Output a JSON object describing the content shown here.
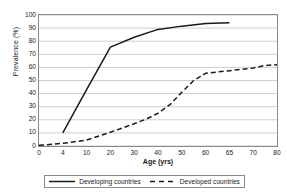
{
  "chart_data": {
    "type": "line",
    "title": "",
    "xlabel": "Age (yrs)",
    "ylabel": "Prevalence (%)",
    "xlim": [
      0,
      80
    ],
    "ylim": [
      0,
      100
    ],
    "grid": true,
    "grid_axis": "y",
    "legend_position": "bottom",
    "xticks": [
      0,
      4,
      10,
      20,
      30,
      40,
      50,
      60,
      65,
      70,
      80
    ],
    "xticklabels": [
      "0",
      "4",
      "10",
      "20",
      "30",
      "40",
      "50",
      "60",
      "65",
      "70",
      "80"
    ],
    "yticks": [
      0,
      10,
      20,
      30,
      40,
      50,
      60,
      70,
      80,
      90,
      100
    ],
    "yticklabels": [
      "0",
      "10",
      "20",
      "30",
      "40",
      "50",
      "60",
      "70",
      "80",
      "90",
      "100"
    ],
    "series": [
      {
        "name": "Developing countries",
        "style": "solid",
        "color": "#1a1a1a",
        "x": [
          4,
          10,
          20,
          30,
          40,
          50,
          60,
          65
        ],
        "y": [
          10,
          43,
          75.5,
          83,
          89,
          91.5,
          93.5,
          94
        ]
      },
      {
        "name": "Developed countries",
        "style": "dashed",
        "color": "#1a1a1a",
        "x": [
          0,
          4,
          10,
          20,
          30,
          35,
          40,
          45,
          50,
          55,
          60,
          65,
          70,
          75,
          80
        ],
        "y": [
          0.5,
          2,
          4.5,
          10.5,
          17,
          20.5,
          25,
          31.5,
          41,
          50,
          55.5,
          57.5,
          59.5,
          61.5,
          62
        ]
      }
    ]
  },
  "legend": {
    "entries": [
      {
        "label": "Developing countries",
        "style": "solid"
      },
      {
        "label": "Developed countries",
        "style": "dashed"
      }
    ]
  },
  "axes": {
    "x_title": "Age (yrs)",
    "y_title": "Prevalence (%)"
  }
}
